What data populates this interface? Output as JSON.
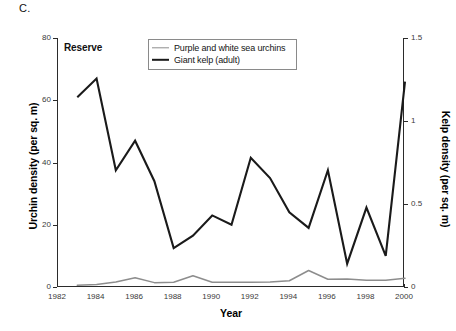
{
  "figure": {
    "panel_letter": "C.",
    "in_plot_label": "Reserve"
  },
  "legend": {
    "position": "top-center-inside",
    "entries": [
      {
        "label": "Purple and white sea urchins",
        "color": "#8d8d8d",
        "style": "thin-line"
      },
      {
        "label": "Giant kelp (adult)",
        "color": "#1a1a1a",
        "style": "thick-line"
      }
    ]
  },
  "axes": {
    "x_title": "Year",
    "y_left_title": "Urchin density (per sq. m)",
    "y_right_title": "Kelp density (per sq. m)",
    "x_ticks": [
      "1982",
      "1984",
      "1986",
      "1988",
      "1990",
      "1992",
      "1994",
      "1996",
      "1998",
      "2000"
    ],
    "y_left_ticks": [
      "0",
      "20",
      "40",
      "60",
      "80"
    ],
    "y_right_ticks": [
      "0",
      "0.5",
      "1",
      "1.5"
    ]
  },
  "chart_data": {
    "type": "line",
    "title": "",
    "subtitle": "",
    "panel": "C.",
    "annotation": "Reserve",
    "xlabel": "Year",
    "ylabel": "Urchin density (per sq. m)",
    "y2label": "Kelp density (per sq. m)",
    "xlim": [
      1982,
      2000
    ],
    "ylim": [
      0,
      80
    ],
    "y2lim": [
      0,
      1.5
    ],
    "xticks": [
      1982,
      1984,
      1986,
      1988,
      1990,
      1992,
      1994,
      1996,
      1998,
      2000
    ],
    "yticks": [
      0,
      20,
      40,
      60,
      80
    ],
    "y2ticks": [
      0,
      0.5,
      1,
      1.5
    ],
    "grid": false,
    "legend_position": "upper center (inside axes)",
    "x": [
      1983,
      1984,
      1985,
      1986,
      1987,
      1988,
      1989,
      1990,
      1991,
      1992,
      1993,
      1994,
      1995,
      1996,
      1997,
      1998,
      1999,
      2000
    ],
    "series": [
      {
        "name": "Purple and white sea urchins",
        "axis": "left",
        "units": "per sq. m",
        "color": "#8d8d8d",
        "values": [
          0.6,
          0.8,
          1.6,
          3.0,
          1.4,
          1.5,
          3.6,
          1.5,
          1.5,
          1.5,
          1.6,
          2.0,
          5.3,
          2.5,
          2.6,
          2.2,
          2.2,
          2.8
        ]
      },
      {
        "name": "Giant kelp (adult)",
        "axis": "right",
        "units": "per sq. m",
        "color": "#1a1a1a",
        "values_left_scale": [
          61,
          67,
          37.5,
          47,
          34,
          12.5,
          16.5,
          23,
          20,
          41.5,
          35,
          24,
          19,
          37.5,
          7.5,
          25.5,
          10,
          66
        ],
        "values": [
          1.09,
          1.2,
          0.67,
          0.84,
          0.61,
          0.22,
          0.29,
          0.41,
          0.36,
          0.74,
          0.63,
          0.43,
          0.34,
          0.67,
          0.13,
          0.46,
          0.18,
          1.18
        ]
      }
    ]
  }
}
